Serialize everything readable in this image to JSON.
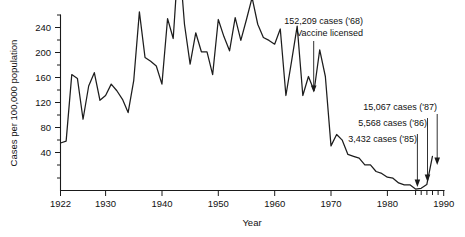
{
  "chart_data": {
    "type": "line",
    "title": "",
    "xlabel": "Year",
    "ylabel": "Cases per 100,000 population",
    "xlim": [
      1922,
      1990
    ],
    "ylim": [
      0,
      260
    ],
    "grid": false,
    "legend": "none",
    "x_ticks": [
      "1922",
      "1930",
      "1940",
      "1950",
      "1960",
      "1970",
      "1980",
      "1990"
    ],
    "x_tick_values": [
      1922,
      1930,
      1940,
      1950,
      1960,
      1970,
      1980,
      1990
    ],
    "y_ticks": [
      "40",
      "80",
      "120",
      "160",
      "200",
      "240"
    ],
    "y_tick_values": [
      40,
      80,
      120,
      160,
      200,
      240
    ],
    "series": [
      {
        "name": "Measles cases per 100,000 population",
        "x": [
          1922,
          1923,
          1924,
          1925,
          1926,
          1927,
          1928,
          1929,
          1930,
          1931,
          1932,
          1933,
          1934,
          1935,
          1936,
          1937,
          1938,
          1939,
          1940,
          1941,
          1942,
          1943,
          1944,
          1945,
          1946,
          1947,
          1948,
          1949,
          1950,
          1951,
          1952,
          1953,
          1954,
          1955,
          1956,
          1957,
          1958,
          1959,
          1960,
          1961,
          1962,
          1963,
          1964,
          1965,
          1966,
          1967,
          1968,
          1969,
          1970,
          1971,
          1972,
          1973,
          1974,
          1975,
          1976,
          1977,
          1978,
          1979,
          1980,
          1981,
          1982,
          1983,
          1984,
          1985,
          1986,
          1987,
          1988
        ],
        "values": [
          50,
          52,
          122,
          118,
          75,
          110,
          124,
          95,
          100,
          112,
          105,
          96,
          82,
          116,
          188,
          140,
          136,
          131,
          112,
          181,
          160,
          250,
          175,
          133,
          166,
          146,
          146,
          122,
          180,
          162,
          147,
          182,
          158,
          180,
          203,
          175,
          161,
          158,
          154,
          170,
          100,
          136,
          173,
          100,
          120,
          105,
          148,
          120,
          47,
          59,
          53,
          38,
          36,
          34,
          27,
          27,
          20,
          18,
          14,
          13,
          8,
          6,
          6,
          1.5,
          2.3,
          6.3,
          36
        ]
      }
    ],
    "annotations": [
      {
        "id": "vaccine",
        "lines": [
          "152,209 cases ('68)",
          "Vaccine licensed"
        ],
        "target_year": 1968,
        "target_value": 148
      },
      {
        "id": "cases-87",
        "lines": [
          "15,067 cases ('87)"
        ],
        "target_year": 1987,
        "target_value": 6.3
      },
      {
        "id": "cases-86",
        "lines": [
          "5,568 cases ('86)"
        ],
        "target_year": 1986,
        "target_value": 2.3
      },
      {
        "id": "cases-85",
        "lines": [
          "3,432 cases ('85)"
        ],
        "target_year": 1985,
        "target_value": 1.5
      }
    ],
    "colors": {
      "line": "#1d1d1d",
      "axis": "#1a1a1a",
      "text": "#111111",
      "background": "#ffffff"
    }
  }
}
